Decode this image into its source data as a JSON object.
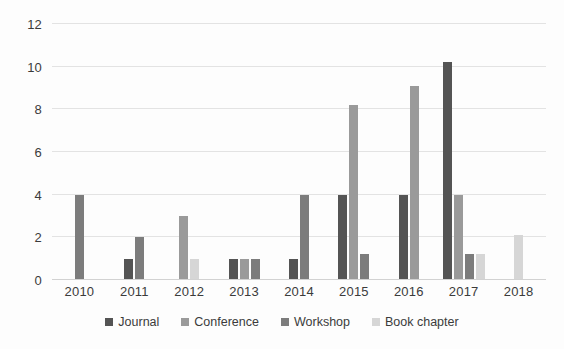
{
  "chart_data": {
    "type": "bar",
    "title": "",
    "subtitle": "",
    "xlabel": "",
    "ylabel": "",
    "categories": [
      "2010",
      "2011",
      "2012",
      "2013",
      "2014",
      "2015",
      "2016",
      "2017",
      "2018"
    ],
    "series": [
      {
        "name": "Journal",
        "color": "#545454",
        "values": [
          0,
          1,
          0,
          1,
          1,
          4,
          4,
          10.2,
          0
        ]
      },
      {
        "name": "Conference",
        "color": "#9a9a9a",
        "values": [
          0,
          0,
          3,
          1,
          0,
          8.2,
          9.1,
          4,
          0
        ]
      },
      {
        "name": "Workshop",
        "color": "#7c7c7c",
        "values": [
          4,
          2,
          0,
          1,
          4,
          1.2,
          0,
          1.2,
          0
        ]
      },
      {
        "name": "Book chapter",
        "color": "#d6d6d6",
        "values": [
          0,
          0,
          1,
          0,
          0,
          0,
          0,
          1.2,
          2.1
        ]
      }
    ],
    "ylim": [
      0,
      12
    ],
    "yticks": [
      0,
      2,
      4,
      6,
      8,
      10,
      12
    ],
    "ytick_labels": [
      "0",
      "2",
      "4",
      "6",
      "8",
      "10",
      "12"
    ],
    "grid": true,
    "grid_axis": "y",
    "legend_position": "bottom",
    "legend_entries": [
      "Journal",
      "Conference",
      "Workshop",
      "Book chapter"
    ]
  }
}
